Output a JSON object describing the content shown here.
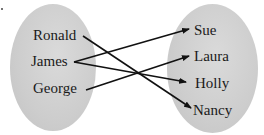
{
  "diagram": {
    "type": "mapping",
    "domain_set": {
      "fill": "#cfcfcf",
      "elements": [
        {
          "label": "Ronald",
          "x": 33,
          "y": 28
        },
        {
          "label": "James",
          "x": 31,
          "y": 54
        },
        {
          "label": "George",
          "x": 33,
          "y": 81
        }
      ]
    },
    "range_set": {
      "fill": "#cfcfcf",
      "elements": [
        {
          "label": "Sue",
          "x": 194,
          "y": 23
        },
        {
          "label": "Laura",
          "x": 194,
          "y": 49
        },
        {
          "label": "Holly",
          "x": 195,
          "y": 76
        },
        {
          "label": "Nancy",
          "x": 193,
          "y": 103
        }
      ]
    },
    "mappings": [
      {
        "from": "Ronald",
        "to": "Nancy"
      },
      {
        "from": "James",
        "to": "Sue"
      },
      {
        "from": "James",
        "to": "Holly"
      },
      {
        "from": "George",
        "to": "Laura"
      }
    ],
    "line_color": "#111111"
  }
}
